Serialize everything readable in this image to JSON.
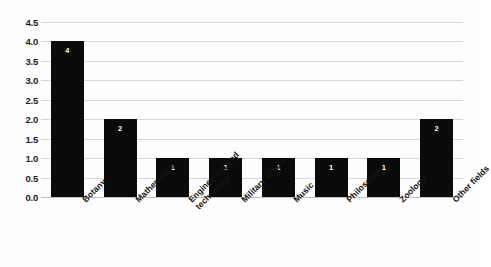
{
  "chart_data": {
    "type": "bar",
    "title": "",
    "subtitle": "",
    "xlabel": "",
    "ylabel": "",
    "ylim": [
      0.0,
      4.5
    ],
    "grid": true,
    "legend": false,
    "orientation": "vertical",
    "bar_color": "#0a0a0a",
    "gridline_color": "#d8d8d8",
    "value_label_color": "#ffffff",
    "categories": [
      "Botany",
      "Mathematics",
      "Engineering and technology",
      "Military affairs",
      "Music",
      "Philosophy",
      "Zoology",
      "Other fields"
    ],
    "category_lines": [
      [
        "Botany"
      ],
      [
        "Mathematics"
      ],
      [
        "Engineering and",
        "technology"
      ],
      [
        "Military affairs"
      ],
      [
        "Music"
      ],
      [
        "Philosophy"
      ],
      [
        "Zoology"
      ],
      [
        "Other fields"
      ]
    ],
    "values": [
      4,
      2,
      1,
      1,
      1,
      1,
      1,
      2
    ],
    "value_labels": [
      "4",
      "2",
      "1",
      "1",
      "1",
      "1",
      "1",
      "2"
    ],
    "yticks": [
      0.0,
      0.5,
      1.0,
      1.5,
      2.0,
      2.5,
      3.0,
      3.5,
      4.0,
      4.5
    ],
    "ytick_labels": [
      "0.0",
      "0.5",
      "1.0",
      "1.5",
      "2.0",
      "2.5",
      "3.0",
      "3.5",
      "4.0",
      "4.5"
    ]
  }
}
